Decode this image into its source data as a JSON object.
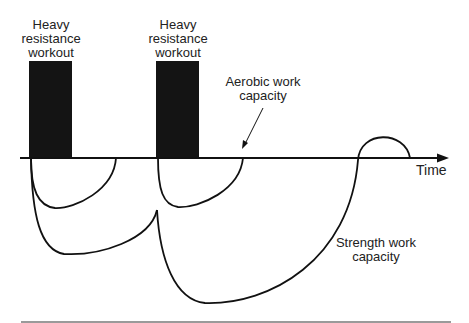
{
  "diagram": {
    "title": "",
    "workouts": [
      {
        "label_lines": [
          "Heavy",
          "resistance",
          "workout"
        ],
        "x": 29,
        "width": 43
      },
      {
        "label_lines": [
          "Heavy",
          "resistance",
          "workout"
        ],
        "x": 156,
        "width": 43
      }
    ],
    "annotations": {
      "aerobic": {
        "lines": [
          "Aerobic work",
          "capacity"
        ]
      },
      "strength": {
        "lines": [
          "Strength work",
          "capacity"
        ]
      }
    },
    "axis": {
      "label": "Time"
    },
    "colors": {
      "workout_block": "#141414",
      "line": "#111111",
      "rule": "#9a9a9a"
    }
  }
}
